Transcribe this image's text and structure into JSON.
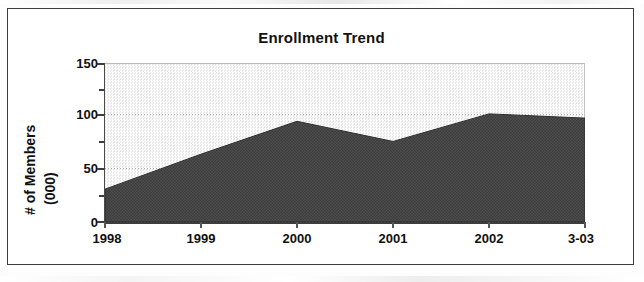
{
  "chart_data": {
    "type": "area",
    "title": "Enrollment Trend",
    "xlabel": "",
    "ylabel": "# of Members (000)",
    "ylabel_line1": "# of Members",
    "ylabel_line2": "(000)",
    "categories": [
      "1998",
      "1999",
      "2000",
      "2001",
      "2002",
      "3-03"
    ],
    "values": [
      31,
      64,
      95,
      76,
      102,
      98
    ],
    "series": [
      {
        "name": "Enrollment",
        "values": [
          31,
          64,
          95,
          76,
          102,
          98
        ]
      }
    ],
    "ylim": [
      0,
      150
    ],
    "ytick_values": [
      0,
      50,
      100,
      150
    ],
    "ytick_labels": [
      "0",
      "50",
      "100",
      "150"
    ],
    "yminor_ticks": [
      25,
      75,
      125
    ],
    "gridlines": [
      50,
      100
    ],
    "grid": true,
    "legend": "none",
    "colors": {
      "area_fill": "#4a4a4a",
      "plot_background": "#f1f1f1",
      "axis": "#3d3d3d",
      "gridline": "#9a9a9a",
      "text": "#111111",
      "frame": "#3d3d3d"
    }
  }
}
